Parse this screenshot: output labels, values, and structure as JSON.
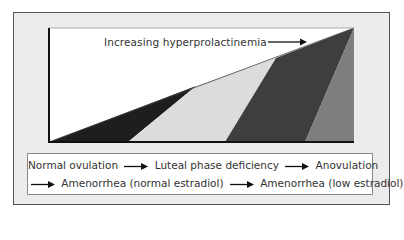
{
  "diagram": {
    "axis_label": "Increasing hyperprolactinemia",
    "colors": {
      "frame_bg": "#ececec",
      "chart_bg": "#ffffff",
      "stage1": "#1e1e1e",
      "stage2": "#dcdcdc",
      "stage3": "#3e3e3e",
      "stage4": "#7e7e7e"
    },
    "stages": [
      "Normal ovulation",
      "Luteal phase deficiency",
      "Anovulation",
      "Amenorrhea (normal estradiol)",
      "Amenorrhea (low estradiol)"
    ]
  }
}
